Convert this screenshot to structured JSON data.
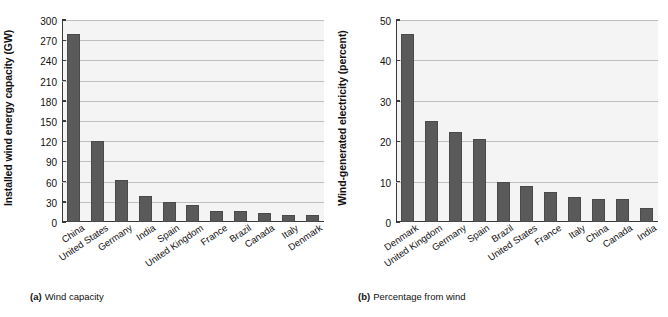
{
  "figure": {
    "background": "#ffffff",
    "bar_color": "#5a5a5a",
    "plot_background": "#f4f4f4",
    "grid_color": "#bfbfbf",
    "axis_color": "#3a3a3a"
  },
  "panel_a": {
    "caption_marker": "(a)",
    "caption_text": "Wind capacity",
    "ylabel": "Installed wind energy capacity (GW)",
    "yticks": [
      "0",
      "30",
      "60",
      "90",
      "120",
      "150",
      "180",
      "210",
      "240",
      "270",
      "300"
    ],
    "categories": [
      "China",
      "United States",
      "Germany",
      "India",
      "Spain",
      "United Kingdom",
      "France",
      "Brazil",
      "Canada",
      "Italy",
      "Denmark"
    ]
  },
  "panel_b": {
    "caption_marker": "(b)",
    "caption_text": "Percentage from wind",
    "ylabel": "Wind-generated electricity (percent)",
    "yticks": [
      "0",
      "10",
      "20",
      "30",
      "40",
      "50"
    ],
    "categories": [
      "Denmark",
      "United Kingdom",
      "Germany",
      "Spain",
      "Brazil",
      "United States",
      "France",
      "Italy",
      "China",
      "Canada",
      "India"
    ]
  },
  "chart_data": [
    {
      "type": "bar",
      "title": "(a) Wind capacity",
      "xlabel": "",
      "ylabel": "Installed wind energy capacity (GW)",
      "ylim": [
        0,
        300
      ],
      "ytick_step": 30,
      "grid": true,
      "legend": "none",
      "categories": [
        "China",
        "United States",
        "Germany",
        "India",
        "Spain",
        "United Kingdom",
        "France",
        "Brazil",
        "Canada",
        "Italy",
        "Denmark"
      ],
      "values": [
        279,
        120,
        62,
        39,
        29,
        25,
        17,
        17,
        13,
        11,
        10
      ],
      "units": "GW"
    },
    {
      "type": "bar",
      "title": "(b) Percentage from wind",
      "xlabel": "",
      "ylabel": "Wind-generated electricity (percent)",
      "ylim": [
        0,
        50
      ],
      "ytick_step": 10,
      "grid": true,
      "legend": "none",
      "categories": [
        "Denmark",
        "United Kingdom",
        "Germany",
        "Spain",
        "Brazil",
        "United States",
        "France",
        "Italy",
        "China",
        "Canada",
        "India"
      ],
      "values": [
        46.5,
        25.0,
        22.2,
        20.5,
        9.8,
        9.0,
        7.5,
        6.3,
        5.8,
        5.7,
        3.4
      ],
      "units": "percent"
    }
  ]
}
